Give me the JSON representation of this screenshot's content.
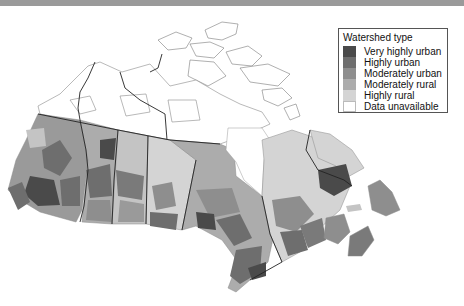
{
  "header": {
    "title_fragment": "...watersheds in Canada, by type..."
  },
  "map": {
    "region": "Canada",
    "description": "Watersheds shaded by urbanization type",
    "colors": {
      "very_highly_urban": "#4a4a4a",
      "highly_urban": "#6e6e6e",
      "moderately_urban": "#8e8e8e",
      "moderately_rural": "#acacac",
      "highly_rural": "#d4d4d4",
      "data_unavailable": "#ffffff",
      "boundary": "#222222",
      "watershed_line": "#8a8a8a"
    }
  },
  "legend": {
    "title": "Watershed type",
    "items": [
      {
        "label": "Very highly urban",
        "color": "#4a4a4a"
      },
      {
        "label": "Highly urban",
        "color": "#6e6e6e"
      },
      {
        "label": "Moderately urban",
        "color": "#8e8e8e"
      },
      {
        "label": "Moderately rural",
        "color": "#acacac"
      },
      {
        "label": "Highly rural",
        "color": "#d4d4d4"
      },
      {
        "label": "Data unavailable",
        "color": "#ffffff"
      }
    ]
  }
}
